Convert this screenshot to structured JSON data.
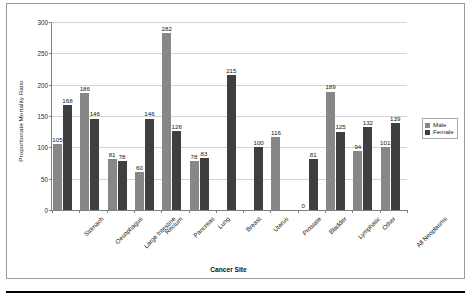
{
  "chart_data": {
    "type": "bar",
    "title": "",
    "xlabel": "Cancer Site",
    "ylabel": "Proportionate Mortality Ratio",
    "ylim": [
      0,
      300
    ],
    "yticks": [
      0,
      50,
      100,
      150,
      200,
      250,
      300
    ],
    "grid": true,
    "legend_position": "right",
    "categories": [
      "Stomach",
      "Oesophagus",
      "Large Intestine",
      "Rectum",
      "Pancreas",
      "Lung",
      "Breast",
      "Uterus",
      "Prostate",
      "Bladder",
      "Lymphatic",
      "Other",
      "All Neoplasms"
    ],
    "series": [
      {
        "name": "Male",
        "color": "#878787",
        "values": [
          105,
          186,
          81,
          60,
          282,
          78,
          null,
          null,
          116,
          0,
          189,
          94,
          101
        ]
      },
      {
        "name": "Female",
        "color": "#3f3f3f",
        "values": [
          168,
          146,
          78,
          146,
          126,
          83,
          215,
          100,
          null,
          81,
          125,
          132,
          139
        ]
      }
    ],
    "data_labels": {
      "Stomach": {
        "Male": "105",
        "Female": "168"
      },
      "Oesophagus": {
        "Male": "186",
        "Female": "146"
      },
      "Large Intestine": {
        "Male": "81",
        "Female": "78"
      },
      "Rectum": {
        "Male": "60",
        "Female": "146"
      },
      "Pancreas": {
        "Male": "282",
        "Female": "126"
      },
      "Lung": {
        "Male": "78",
        "Female": "83"
      },
      "Breast": {
        "Male": "",
        "Female": "215"
      },
      "Uterus": {
        "Male": "",
        "Female": "100"
      },
      "Prostate": {
        "Male": "116",
        "Female": ""
      },
      "Bladder": {
        "Male": "0",
        "Female": "81"
      },
      "Lymphatic": {
        "Male": "189",
        "Female": "125"
      },
      "Other": {
        "Male": "94",
        "Female": "132"
      },
      "All Neoplasms": {
        "Male": "101",
        "Female": "139"
      }
    }
  },
  "legend": {
    "items": [
      {
        "label": "Male",
        "color": "#878787"
      },
      {
        "label": "Female",
        "color": "#3f3f3f"
      }
    ]
  }
}
